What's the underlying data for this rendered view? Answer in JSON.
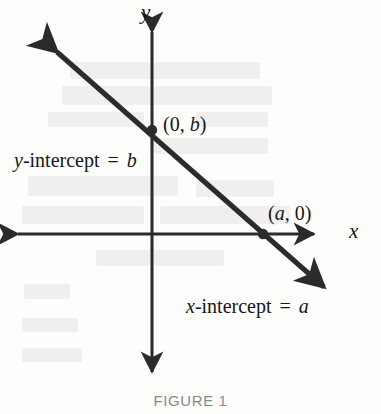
{
  "figure": {
    "caption": "FIGURE 1",
    "background_color": "#fdfdfc",
    "ink_color": "#2b2b2b",
    "text_color": "#171717",
    "caption_color": "#8a8a8a"
  },
  "axes": {
    "x_axis_label": "x",
    "y_axis_label": "y",
    "origin": {
      "x": 152,
      "y": 234
    },
    "x_axis": {
      "from_x": 12,
      "to_x": 320,
      "y": 234,
      "arrows": "both"
    },
    "y_axis": {
      "x": 152,
      "from_y": 26,
      "to_y": 378,
      "arrows": "both"
    }
  },
  "line": {
    "start": {
      "x": 48,
      "y": 44
    },
    "end": {
      "x": 333,
      "y": 295
    },
    "arrows": "both",
    "stroke_width": 5
  },
  "points": [
    {
      "name": "y-intercept",
      "label_open": "(0, ",
      "label_var": "b",
      "label_close": ")",
      "dot": {
        "x": 152,
        "y": 130
      },
      "label_pos": {
        "x": 163,
        "y": 114
      }
    },
    {
      "name": "x-intercept",
      "label_open": "(",
      "label_var": "a",
      "label_close": ", 0)",
      "dot": {
        "x": 263,
        "y": 234
      },
      "label_pos": {
        "x": 268,
        "y": 203
      }
    }
  ],
  "annotations": [
    {
      "name": "y-intercept-equation",
      "var_lead": "y",
      "text_mid": "-intercept",
      "equals": "=",
      "var_tail": "b",
      "pos": {
        "x": 14,
        "y": 150
      }
    },
    {
      "name": "x-intercept-equation",
      "var_lead": "x",
      "text_mid": "-intercept",
      "equals": "=",
      "var_tail": "a",
      "pos": {
        "x": 186,
        "y": 296
      }
    }
  ],
  "bleed_through": [
    {
      "x": 70,
      "y": 62,
      "w": 190,
      "h": 17
    },
    {
      "x": 62,
      "y": 86,
      "w": 210,
      "h": 19
    },
    {
      "x": 48,
      "y": 112,
      "w": 96,
      "h": 15
    },
    {
      "x": 196,
      "y": 112,
      "w": 72,
      "h": 15
    },
    {
      "x": 150,
      "y": 138,
      "w": 118,
      "h": 16
    },
    {
      "x": 28,
      "y": 176,
      "w": 150,
      "h": 20
    },
    {
      "x": 196,
      "y": 180,
      "w": 78,
      "h": 17
    },
    {
      "x": 22,
      "y": 206,
      "w": 122,
      "h": 18
    },
    {
      "x": 160,
      "y": 206,
      "w": 130,
      "h": 18
    },
    {
      "x": 96,
      "y": 250,
      "w": 128,
      "h": 16
    },
    {
      "x": 24,
      "y": 284,
      "w": 46,
      "h": 15
    },
    {
      "x": 22,
      "y": 318,
      "w": 56,
      "h": 14
    },
    {
      "x": 22,
      "y": 348,
      "w": 60,
      "h": 14
    }
  ]
}
